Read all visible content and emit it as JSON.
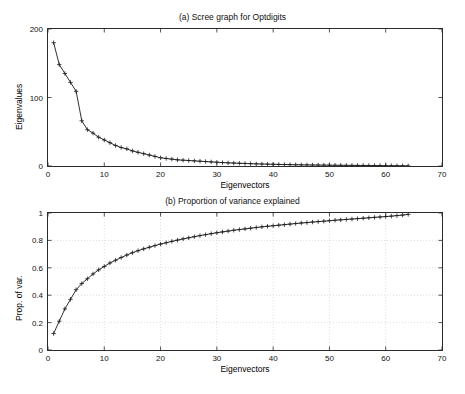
{
  "figure": {
    "background": "#ffffff",
    "axis_color": "#2b2b2b",
    "grid_color": "#c8c8c8",
    "marker_color": "#1a1a1a",
    "line_color": "#1a1a1a"
  },
  "chart_data": [
    {
      "type": "line",
      "panel": "a",
      "title": "(a) Scree graph for Optdigits",
      "xlabel": "Eigenvectors",
      "ylabel": "Eigenvalues",
      "xlim": [
        0,
        70
      ],
      "ylim": [
        0,
        200
      ],
      "xticks": [
        0,
        10,
        20,
        30,
        40,
        50,
        60,
        70
      ],
      "yticks": [
        0,
        100,
        200
      ],
      "grid": false,
      "marker": "plus",
      "x": [
        1,
        2,
        3,
        4,
        5,
        6,
        7,
        8,
        9,
        10,
        11,
        12,
        13,
        14,
        15,
        16,
        17,
        18,
        19,
        20,
        21,
        22,
        23,
        24,
        25,
        26,
        27,
        28,
        29,
        30,
        31,
        32,
        33,
        34,
        35,
        36,
        37,
        38,
        39,
        40,
        41,
        42,
        43,
        44,
        45,
        46,
        47,
        48,
        49,
        50,
        51,
        52,
        53,
        54,
        55,
        56,
        57,
        58,
        59,
        60,
        61,
        62,
        63,
        64
      ],
      "y": [
        180,
        148,
        135,
        122,
        109,
        66,
        53,
        48,
        42,
        38,
        34,
        30,
        27,
        25,
        22,
        20,
        18,
        16,
        14,
        12,
        11,
        10,
        9,
        8.5,
        8,
        7.5,
        7,
        6.5,
        6,
        5.5,
        5,
        4.6,
        4.3,
        4,
        3.7,
        3.4,
        3.1,
        2.9,
        2.7,
        2.5,
        2.3,
        2.1,
        2,
        1.8,
        1.7,
        1.6,
        1.5,
        1.4,
        1.3,
        1.2,
        1.1,
        1,
        0.95,
        0.9,
        0.85,
        0.8,
        0.75,
        0.7,
        0.6,
        0.5,
        0.45,
        0.4,
        0.3,
        0.2
      ]
    },
    {
      "type": "line",
      "panel": "b",
      "title": "(b) Proportion of variance explained",
      "xlabel": "Eigenvectors",
      "ylabel": "Prop. of var.",
      "xlim": [
        0,
        70
      ],
      "ylim": [
        0,
        1
      ],
      "xticks": [
        0,
        10,
        20,
        30,
        40,
        50,
        60,
        70
      ],
      "yticks": [
        0,
        0.2,
        0.4,
        0.6,
        0.8,
        1
      ],
      "grid": true,
      "marker": "plus",
      "x": [
        1,
        2,
        3,
        4,
        5,
        6,
        7,
        8,
        9,
        10,
        11,
        12,
        13,
        14,
        15,
        16,
        17,
        18,
        19,
        20,
        21,
        22,
        23,
        24,
        25,
        26,
        27,
        28,
        29,
        30,
        31,
        32,
        33,
        34,
        35,
        36,
        37,
        38,
        39,
        40,
        41,
        42,
        43,
        44,
        45,
        46,
        47,
        48,
        49,
        50,
        51,
        52,
        53,
        54,
        55,
        56,
        57,
        58,
        59,
        60,
        61,
        62,
        63,
        64
      ],
      "y": [
        0.12,
        0.21,
        0.3,
        0.37,
        0.44,
        0.485,
        0.52,
        0.555,
        0.585,
        0.61,
        0.635,
        0.655,
        0.675,
        0.693,
        0.71,
        0.725,
        0.738,
        0.75,
        0.762,
        0.773,
        0.783,
        0.793,
        0.802,
        0.811,
        0.819,
        0.827,
        0.835,
        0.842,
        0.849,
        0.856,
        0.862,
        0.868,
        0.874,
        0.879,
        0.884,
        0.889,
        0.894,
        0.899,
        0.903,
        0.907,
        0.911,
        0.915,
        0.919,
        0.923,
        0.927,
        0.93,
        0.934,
        0.937,
        0.94,
        0.944,
        0.947,
        0.95,
        0.953,
        0.956,
        0.959,
        0.962,
        0.965,
        0.968,
        0.971,
        0.974,
        0.977,
        0.981,
        0.985,
        0.99
      ]
    }
  ]
}
